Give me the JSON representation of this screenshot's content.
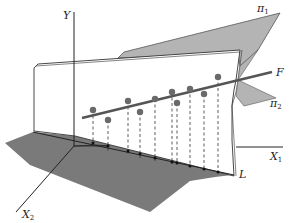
{
  "figure": {
    "labels": {
      "y_axis": "Y",
      "x1_axis": "X",
      "x1_sub": "1",
      "x2_axis": "X",
      "x2_sub": "2",
      "line_f": "F",
      "line_l": "L",
      "plane1": "π",
      "plane1_sub": "1",
      "plane2": "π",
      "plane2_sub": "2"
    },
    "colors": {
      "plane_fill": "#b4b4b4",
      "shadow_fill": "#7a7a7a",
      "line_color": "#555555",
      "point_color": "#6a6a6a",
      "axis_color": "#222222",
      "background": "#ffffff"
    },
    "points": [
      {
        "cx": 93,
        "cy": 110
      },
      {
        "cx": 108,
        "cy": 120
      },
      {
        "cx": 128,
        "cy": 101
      },
      {
        "cx": 140,
        "cy": 112
      },
      {
        "cx": 155,
        "cy": 99
      },
      {
        "cx": 172,
        "cy": 92
      },
      {
        "cx": 177,
        "cy": 103
      },
      {
        "cx": 190,
        "cy": 89
      },
      {
        "cx": 204,
        "cy": 94
      },
      {
        "cx": 218,
        "cy": 77
      }
    ]
  }
}
